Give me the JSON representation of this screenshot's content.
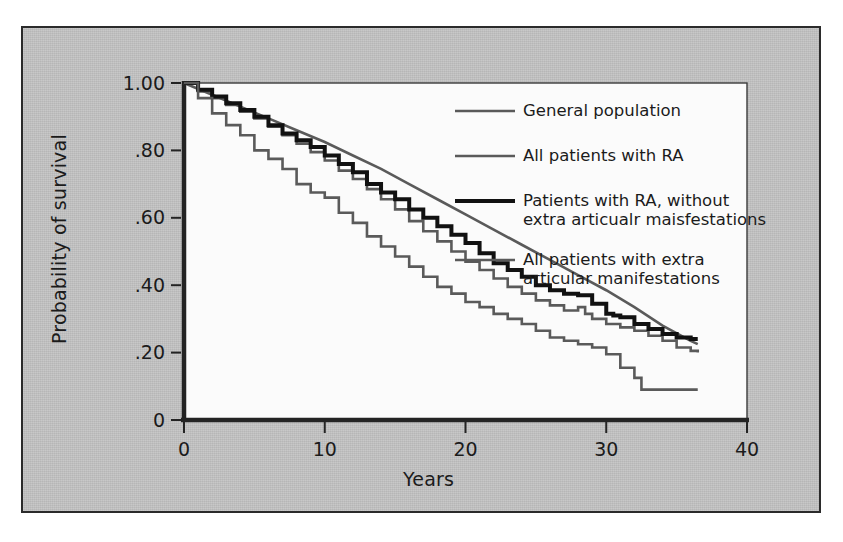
{
  "figure": {
    "background_color": "#c3c3c3",
    "plot_background_color": "#fbfbfb",
    "border_color": "#2b2b2b"
  },
  "axes": {
    "y_title": "Probability of survival",
    "x_title": "Years",
    "y_ticks": [
      "1.00",
      ".80",
      ".60",
      ".40",
      ".20",
      "0"
    ],
    "y_tick_values": [
      1.0,
      0.8,
      0.6,
      0.4,
      0.2,
      0.0
    ],
    "x_ticks": [
      "0",
      "10",
      "20",
      "30",
      "40"
    ],
    "x_tick_values": [
      0,
      10,
      20,
      30,
      40
    ]
  },
  "legend": {
    "position": "top-right-inside",
    "items": [
      {
        "label": "General population",
        "color": "#5a5a5a",
        "width": 2.6
      },
      {
        "label": "All patients with RA",
        "color": "#5a5a5a",
        "width": 2.6
      },
      {
        "label": "Patients with RA, without\nextra articualr maisfestations",
        "color": "#111111",
        "width": 4.0
      },
      {
        "label": "All patients with extra\narticular manifestations",
        "color": "#5a5a5a",
        "width": 2.6
      }
    ]
  },
  "chart_data": {
    "type": "line",
    "title": "",
    "subtitle": "",
    "xlabel": "Years",
    "ylabel": "Probability of survival",
    "xlim": [
      0,
      40
    ],
    "ylim": [
      0,
      1.0
    ],
    "grid": false,
    "legend_position": "upper right",
    "annotations": [],
    "series": [
      {
        "name": "General population",
        "color": "#5a5a5a",
        "linewidth": 2.6,
        "style": "smooth",
        "points": [
          [
            0,
            1.0
          ],
          [
            2,
            0.965
          ],
          [
            4,
            0.93
          ],
          [
            6,
            0.895
          ],
          [
            8,
            0.86
          ],
          [
            10,
            0.825
          ],
          [
            12,
            0.785
          ],
          [
            14,
            0.745
          ],
          [
            16,
            0.7
          ],
          [
            18,
            0.655
          ],
          [
            20,
            0.61
          ],
          [
            22,
            0.565
          ],
          [
            24,
            0.52
          ],
          [
            26,
            0.475
          ],
          [
            28,
            0.43
          ],
          [
            30,
            0.385
          ],
          [
            32,
            0.335
          ],
          [
            34,
            0.28
          ],
          [
            36,
            0.235
          ],
          [
            36.5,
            0.225
          ]
        ]
      },
      {
        "name": "All patients with RA",
        "color": "#5a5a5a",
        "linewidth": 2.6,
        "style": "step",
        "points": [
          [
            0,
            1.0
          ],
          [
            1,
            0.975
          ],
          [
            2,
            0.955
          ],
          [
            3,
            0.935
          ],
          [
            4,
            0.915
          ],
          [
            5,
            0.895
          ],
          [
            6,
            0.87
          ],
          [
            7,
            0.845
          ],
          [
            8,
            0.82
          ],
          [
            9,
            0.795
          ],
          [
            10,
            0.77
          ],
          [
            11,
            0.74
          ],
          [
            12,
            0.715
          ],
          [
            13,
            0.685
          ],
          [
            14,
            0.655
          ],
          [
            15,
            0.625
          ],
          [
            16,
            0.59
          ],
          [
            17,
            0.56
          ],
          [
            18,
            0.53
          ],
          [
            19,
            0.5
          ],
          [
            20,
            0.47
          ],
          [
            21,
            0.445
          ],
          [
            22,
            0.42
          ],
          [
            23,
            0.395
          ],
          [
            24,
            0.375
          ],
          [
            25,
            0.355
          ],
          [
            26,
            0.34
          ],
          [
            27,
            0.325
          ],
          [
            28,
            0.335
          ],
          [
            28.5,
            0.315
          ],
          [
            29,
            0.3
          ],
          [
            30,
            0.285
          ],
          [
            31,
            0.275
          ],
          [
            32,
            0.265
          ],
          [
            33,
            0.25
          ],
          [
            34,
            0.235
          ],
          [
            35,
            0.215
          ],
          [
            36,
            0.205
          ],
          [
            36.5,
            0.2
          ]
        ]
      },
      {
        "name": "Patients with RA, without extra articualr maisfestations",
        "color": "#111111",
        "linewidth": 4.0,
        "style": "step",
        "points": [
          [
            0,
            1.0
          ],
          [
            1,
            0.98
          ],
          [
            2,
            0.96
          ],
          [
            3,
            0.94
          ],
          [
            4,
            0.92
          ],
          [
            5,
            0.9
          ],
          [
            6,
            0.875
          ],
          [
            7,
            0.85
          ],
          [
            8,
            0.83
          ],
          [
            9,
            0.81
          ],
          [
            10,
            0.785
          ],
          [
            11,
            0.76
          ],
          [
            12,
            0.735
          ],
          [
            13,
            0.7
          ],
          [
            14,
            0.675
          ],
          [
            15,
            0.655
          ],
          [
            16,
            0.625
          ],
          [
            17,
            0.6
          ],
          [
            18,
            0.575
          ],
          [
            19,
            0.55
          ],
          [
            20,
            0.525
          ],
          [
            21,
            0.495
          ],
          [
            22,
            0.465
          ],
          [
            23,
            0.445
          ],
          [
            24,
            0.425
          ],
          [
            25,
            0.4
          ],
          [
            26,
            0.385
          ],
          [
            27,
            0.375
          ],
          [
            28,
            0.37
          ],
          [
            29,
            0.345
          ],
          [
            30,
            0.315
          ],
          [
            30.5,
            0.31
          ],
          [
            31,
            0.305
          ],
          [
            32,
            0.285
          ],
          [
            33,
            0.27
          ],
          [
            34,
            0.255
          ],
          [
            35,
            0.245
          ],
          [
            36,
            0.24
          ],
          [
            36.5,
            0.24
          ]
        ]
      },
      {
        "name": "All patients with extra articular manifestations",
        "color": "#5a5a5a",
        "linewidth": 2.6,
        "style": "step",
        "points": [
          [
            0,
            1.0
          ],
          [
            1,
            0.955
          ],
          [
            2,
            0.91
          ],
          [
            3,
            0.875
          ],
          [
            4,
            0.845
          ],
          [
            5,
            0.8
          ],
          [
            6,
            0.775
          ],
          [
            7,
            0.745
          ],
          [
            8,
            0.7
          ],
          [
            9,
            0.675
          ],
          [
            10,
            0.66
          ],
          [
            11,
            0.615
          ],
          [
            12,
            0.585
          ],
          [
            13,
            0.545
          ],
          [
            14,
            0.515
          ],
          [
            15,
            0.485
          ],
          [
            16,
            0.455
          ],
          [
            17,
            0.425
          ],
          [
            18,
            0.395
          ],
          [
            19,
            0.375
          ],
          [
            20,
            0.35
          ],
          [
            21,
            0.335
          ],
          [
            22,
            0.315
          ],
          [
            23,
            0.3
          ],
          [
            24,
            0.285
          ],
          [
            25,
            0.265
          ],
          [
            26,
            0.245
          ],
          [
            27,
            0.235
          ],
          [
            28,
            0.225
          ],
          [
            29,
            0.215
          ],
          [
            30,
            0.195
          ],
          [
            31,
            0.155
          ],
          [
            32,
            0.125
          ],
          [
            32.5,
            0.09
          ],
          [
            34,
            0.09
          ],
          [
            36.5,
            0.09
          ]
        ]
      }
    ]
  }
}
